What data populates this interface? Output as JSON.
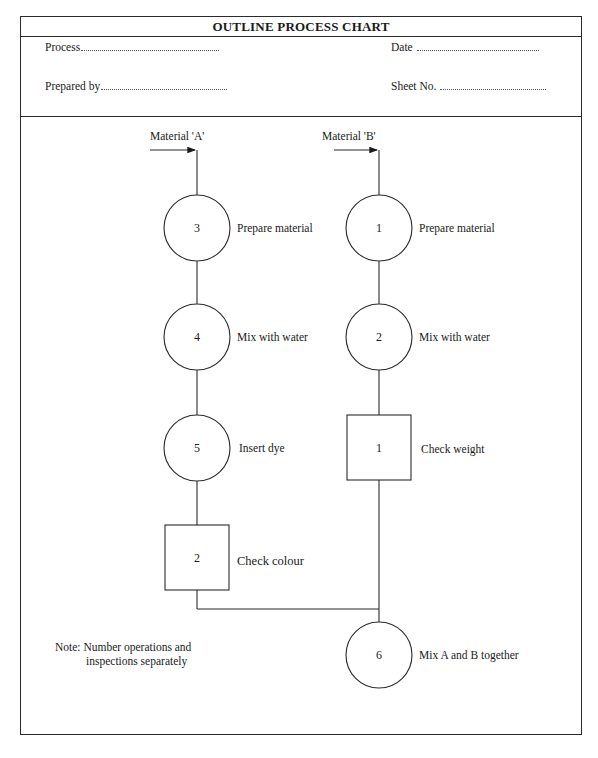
{
  "chart": {
    "title": "OUTLINE PROCESS CHART",
    "header_fields": {
      "process": "Process",
      "date": "Date",
      "prepared_by": "Prepared by",
      "sheet_no": "Sheet No."
    }
  },
  "inputs": {
    "material_a": "Material 'A'",
    "material_b": "Material 'B'"
  },
  "column_a": [
    {
      "type": "operation",
      "number": "3",
      "label": "Prepare material"
    },
    {
      "type": "operation",
      "number": "4",
      "label": "Mix with water"
    },
    {
      "type": "operation",
      "number": "5",
      "label": "Insert dye"
    },
    {
      "type": "inspection",
      "number": "2",
      "label": "Check colour"
    }
  ],
  "column_b": [
    {
      "type": "operation",
      "number": "1",
      "label": "Prepare material"
    },
    {
      "type": "operation",
      "number": "2",
      "label": "Mix with water"
    },
    {
      "type": "inspection",
      "number": "1",
      "label": "Check weight"
    }
  ],
  "merge": {
    "type": "operation",
    "number": "6",
    "label": "Mix A and B together"
  },
  "note": {
    "line1": "Note: Number operations and",
    "line2": "inspections separately"
  }
}
